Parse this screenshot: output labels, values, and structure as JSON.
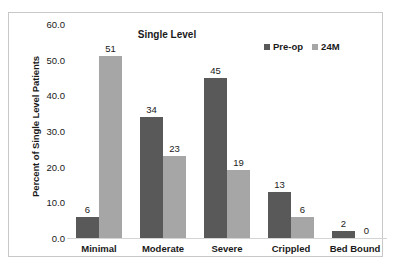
{
  "chart_data": {
    "type": "bar",
    "title": "Single Level",
    "xlabel": "",
    "ylabel": "Percent of Single Level Patients",
    "categories": [
      "Minimal",
      "Moderate",
      "Severe",
      "Crippled",
      "Bed Bound"
    ],
    "series": [
      {
        "name": "Pre-op",
        "values": [
          6,
          34,
          45,
          13,
          2
        ],
        "color": "#595959"
      },
      {
        "name": "24M",
        "values": [
          51,
          23,
          19,
          6,
          0
        ],
        "color": "#a6a6a6"
      }
    ],
    "ylim": [
      0,
      60
    ],
    "yticks": [
      "0.0",
      "10.0",
      "20.0",
      "30.0",
      "40.0",
      "50.0",
      "60.0"
    ],
    "ytick_values": [
      0,
      10,
      20,
      30,
      40,
      50,
      60
    ],
    "grid": false,
    "legend_position": "top-right",
    "data_labels": true
  },
  "legend": {
    "entries": [
      {
        "label": "Pre-op",
        "color": "#595959"
      },
      {
        "label": "24M",
        "color": "#a6a6a6"
      }
    ]
  },
  "colors": {
    "preop": "#595959",
    "month24": "#a6a6a6",
    "frame": "#c8c8c8",
    "baseline": "#d4d4d4",
    "text": "#1a1a1a"
  }
}
